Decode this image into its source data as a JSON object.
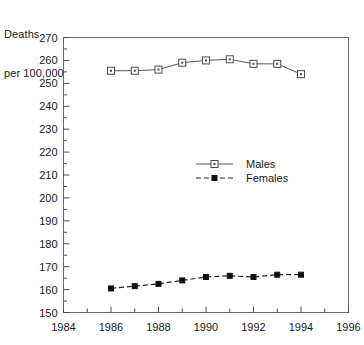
{
  "chart_data": {
    "type": "line",
    "title": "",
    "ylabel_lines": [
      "Deaths",
      "per 100,000"
    ],
    "ylabel": "Deaths per 100,000",
    "xlabel": "",
    "x": [
      1986,
      1987,
      1988,
      1989,
      1990,
      1991,
      1992,
      1993,
      1994
    ],
    "categories": [
      "1986",
      "1987",
      "1988",
      "1989",
      "1990",
      "1991",
      "1992",
      "1993",
      "1994"
    ],
    "series": [
      {
        "name": "Males",
        "marker": "open-square",
        "linestyle": "solid",
        "values": [
          255.5,
          255.5,
          256,
          259,
          260,
          260.5,
          258.5,
          258.5,
          254
        ]
      },
      {
        "name": "Females",
        "marker": "filled-square",
        "linestyle": "dashed",
        "values": [
          160.5,
          161.5,
          162.5,
          164,
          165.5,
          166,
          165.5,
          166.5,
          166.5
        ]
      }
    ],
    "xlim": [
      1984,
      1996
    ],
    "ylim": [
      150,
      270
    ],
    "ytick_step": 10,
    "ytick_minor_step": 5,
    "xtick_step": 1,
    "xtick_label_step": 2,
    "ytick_labels": [
      "270",
      "260",
      "250",
      "240",
      "230",
      "220",
      "210",
      "200",
      "190",
      "180",
      "170",
      "160",
      "150"
    ],
    "ytick_values": [
      270,
      260,
      250,
      240,
      230,
      220,
      210,
      200,
      190,
      180,
      170,
      160,
      150
    ],
    "xtick_labels": [
      "1984",
      "1986",
      "1988",
      "1990",
      "1992",
      "1994",
      "1996"
    ],
    "xtick_values": [
      1984,
      1986,
      1988,
      1990,
      1992,
      1994,
      1996
    ],
    "grid": false,
    "legend_position": "center",
    "legend_entries": [
      "Males",
      "Females"
    ],
    "colors": {
      "males_line": "#555555",
      "females_line": "#222222",
      "frame": "#6b6b6b",
      "text": "#1a1a1a",
      "background": "#ffffff"
    }
  }
}
